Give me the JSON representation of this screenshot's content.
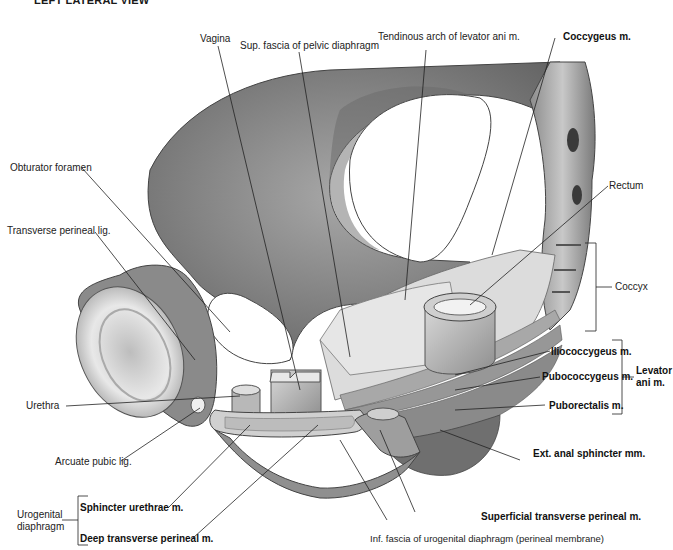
{
  "title": "LEFT LATERAL VIEW",
  "labels": {
    "sup_fascia": "Sup. fascia of pelvic diaphragm",
    "vagina": "Vagina",
    "tendinous_arch": "Tendinous arch of levator ani m.",
    "coccygeus": "Coccygeus m.",
    "obturator_foramen": "Obturator foramen",
    "rectum": "Rectum",
    "transverse_perineal_lig": "Transverse perineal lig.",
    "coccyx": "Coccyx",
    "iliococcygeus": "Iliococcygeus m.",
    "pubococcygeus": "Pubococcygeus m.",
    "puborectalis": "Puborectalis m.",
    "levator_ani_line1": "Levator",
    "levator_ani_line2": "ani m.",
    "urethra": "Urethra",
    "ext_anal_sphincter": "Ext. anal sphincter mm.",
    "arcuate_pubic_lig": "Arcuate pubic lig.",
    "urogenital_line1": "Urogenital",
    "urogenital_line2": "diaphragm",
    "sphincter_urethrae": "Sphincter urethrae m.",
    "deep_transverse_perineal": "Deep transverse perineal m.",
    "superficial_transverse_perineal": "Superficial transverse perineal m.",
    "inf_fascia": "Inf. fascia of urogenital diaphragm (perineal membrane)"
  },
  "colors": {
    "bone_dark": "#6e6e6e",
    "bone_mid": "#9a9a9a",
    "bone_light": "#cfcfcf",
    "muscle": "#b5b5b5",
    "fascia": "#e2e2e2",
    "line": "#222222"
  }
}
